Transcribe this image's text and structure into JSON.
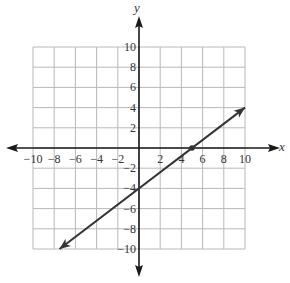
{
  "chart_data": {
    "type": "line",
    "title": "",
    "xlabel": "x",
    "ylabel": "y",
    "xlim": [
      -10,
      10
    ],
    "ylim": [
      -10,
      10
    ],
    "grid": true,
    "grid_step": 2,
    "x_ticks": [
      -10,
      -8,
      -6,
      -4,
      -2,
      2,
      4,
      6,
      8,
      10
    ],
    "y_ticks": [
      10,
      8,
      6,
      4,
      2,
      -2,
      -4,
      -6,
      -8,
      -10
    ],
    "x_tick_labels": [
      "−10",
      "−8",
      "−6",
      "−4",
      "−2",
      "2",
      "4",
      "6",
      "8",
      "10"
    ],
    "y_tick_labels": [
      "10",
      "8",
      "6",
      "4",
      "2",
      "−2",
      "−4",
      "−6",
      "−8",
      "−10"
    ],
    "series": [
      {
        "name": "line",
        "equation": "y = 0.8x - 4",
        "slope": 0.8,
        "y_intercept": -4,
        "x_intercept": 5,
        "points": [
          [
            -7.5,
            -10
          ],
          [
            0,
            -4
          ],
          [
            5,
            0
          ],
          [
            10,
            4
          ]
        ],
        "arrows": "both",
        "color": "#333333"
      }
    ],
    "marked_points": [
      [
        5,
        0
      ]
    ],
    "legend": null
  },
  "colors": {
    "grid": "#b8b8b8",
    "axis": "#1a1a1a",
    "line": "#333333",
    "text": "#333333"
  }
}
